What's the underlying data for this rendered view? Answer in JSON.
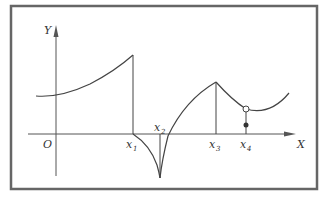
{
  "figure": {
    "axis_labels": {
      "y": "Y",
      "x": "X",
      "origin": "O"
    },
    "x_marks": [
      {
        "base": "x",
        "sub": "1"
      },
      {
        "base": "x",
        "sub": "2"
      },
      {
        "base": "x",
        "sub": "3"
      },
      {
        "base": "x",
        "sub": "4"
      }
    ],
    "colors": {
      "border": "#666666",
      "stroke": "#444444",
      "background": "#ffffff"
    }
  }
}
